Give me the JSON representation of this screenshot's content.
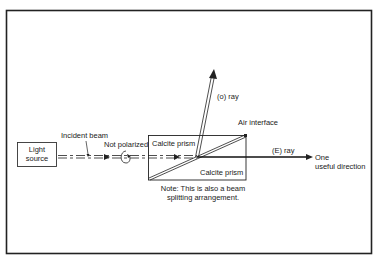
{
  "diagram": {
    "type": "optics-schematic",
    "labels": {
      "light_source_line1": "Light",
      "light_source_line2": "source",
      "incident_beam": "Incident beam",
      "not_polarized": "Not polarized",
      "calcite_prism_top": "Calcite prism",
      "calcite_prism_bottom": "Calcite prism",
      "o_ray": "(o) ray",
      "air_interface": "Air interface",
      "e_ray": "(E) ray",
      "useful_direction_line1": "One",
      "useful_direction_line2": "useful direction",
      "note_line1": "Note: This is also a beam",
      "note_line2": "splitting arrangement."
    },
    "colors": {
      "ink": "#222222",
      "background": "#ffffff"
    }
  }
}
